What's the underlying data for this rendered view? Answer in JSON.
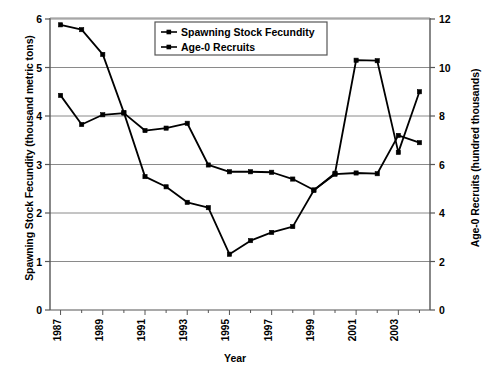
{
  "chart_data": {
    "type": "line",
    "title": "",
    "xlabel": "Year",
    "ylabel": "Spawning Stock Fecundity (thousand metric tons)",
    "ylabel_right": "Age-0 Recruits (hundred thousands)",
    "x": [
      1987,
      1988,
      1989,
      1990,
      1991,
      1992,
      1993,
      1994,
      1995,
      1996,
      1997,
      1998,
      1999,
      2000,
      2001,
      2002,
      2003,
      2004
    ],
    "xlim": [
      1986.5,
      2004.5
    ],
    "xtick_labels": [
      "1987",
      "1989",
      "1991",
      "1993",
      "1995",
      "1997",
      "1999",
      "2001",
      "2003"
    ],
    "xticks": [
      1987,
      1989,
      1991,
      1993,
      1995,
      1997,
      1999,
      2001,
      2003
    ],
    "ylim": [
      0,
      6
    ],
    "yticks": [
      0,
      1,
      2,
      3,
      4,
      5,
      6
    ],
    "ytick_labels": [
      "0",
      "1",
      "2",
      "3",
      "4",
      "5",
      "6"
    ],
    "ylim_right": [
      0,
      12
    ],
    "yticks_right": [
      0,
      2,
      4,
      6,
      8,
      10,
      12
    ],
    "ytick_labels_right": [
      "0",
      "2",
      "4",
      "6",
      "8",
      "10",
      "12"
    ],
    "grid": true,
    "legend_position": "top-center",
    "series": [
      {
        "name": "Spawning Stock Fecundity",
        "axis": "left",
        "marker": "square",
        "color": "#000000",
        "values": [
          5.88,
          5.78,
          5.27,
          4.07,
          2.75,
          2.54,
          2.22,
          2.11,
          1.15,
          1.43,
          1.6,
          1.72,
          2.47,
          2.82,
          5.15,
          5.14,
          3.25,
          4.5
        ]
      },
      {
        "name": "Age-0 Recruits",
        "axis": "right",
        "marker": "square",
        "color": "#000000",
        "values": [
          8.85,
          7.65,
          8.05,
          8.12,
          7.4,
          7.5,
          7.7,
          5.98,
          5.7,
          5.7,
          5.68,
          5.4,
          4.95,
          5.6,
          5.65,
          5.62,
          7.2,
          6.9
        ]
      }
    ],
    "series_extra_note": ""
  },
  "legend": {
    "entries": [
      {
        "label": "Spawning Stock Fecundity"
      },
      {
        "label": "Age-0 Recruits"
      }
    ]
  },
  "axes": {
    "x_title": "Year",
    "y_left_title": "Spawning Stock Fecundity (thousand metric tons)",
    "y_right_title": "Age-0 Recruits (hundred thousands)"
  }
}
